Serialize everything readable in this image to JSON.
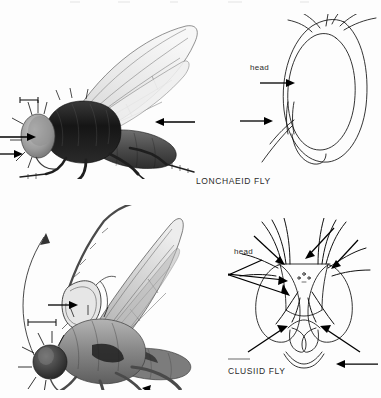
{
  "figure": {
    "title_visible": false,
    "background_color": "#fdfdfd",
    "ink_color": "#1a1a1a",
    "width": 381,
    "height": 398
  },
  "panels": [
    {
      "id": "lonchaeid-habitus",
      "kind": "habitus-illustration",
      "view": "lateral",
      "subject": "Lonchaeid fly",
      "rendering": "stipple-halftone",
      "features_marked": [
        {
          "name": "head",
          "arrow_direction": "right",
          "note": "arrow pointing to head"
        },
        {
          "name": "face",
          "arrow_direction": "right",
          "note": "lower arrow pointing to face"
        },
        {
          "name": "wing-base",
          "arrow_direction": "left",
          "note": "arrow pointing to wing base / calypter"
        }
      ],
      "scale_bar": {
        "present": true,
        "orientation": "horizontal",
        "label": ""
      }
    },
    {
      "id": "lonchaeid-head",
      "kind": "line-diagram",
      "view": "lateral",
      "subject": "Lonchaeid fly head",
      "label": "head",
      "features_marked": [
        {
          "name": "eye",
          "arrow_direction": "right"
        },
        {
          "name": "lower-facial-bristle",
          "arrow_direction": "right"
        }
      ]
    },
    {
      "id": "clusiid-habitus",
      "kind": "habitus-illustration",
      "view": "lateral",
      "subject": "Clusiid fly",
      "rendering": "stipple-halftone",
      "features_marked": [
        {
          "name": "antenna-inset",
          "arrow_direction": "right",
          "note": "magnified antenna inset with curved leader"
        },
        {
          "name": "tarsus",
          "arrow_direction": "right",
          "note": "arrow pointing to hind tarsus"
        }
      ],
      "scale_bar": {
        "present": true,
        "orientation": "horizontal",
        "label": ""
      },
      "inset": {
        "present": true,
        "subject": "antenna",
        "magnified": true
      }
    },
    {
      "id": "clusiid-head",
      "kind": "line-diagram",
      "view": "frontal",
      "subject": "Clusiid fly head",
      "label": "head",
      "features_marked": [
        {
          "name": "frontal-bristle-upper",
          "arrow_direction": "right"
        },
        {
          "name": "frontal-bristle-middle",
          "arrow_direction": "right"
        },
        {
          "name": "frontal-bristle-lower",
          "arrow_direction": "right"
        },
        {
          "name": "ocellar-bristle",
          "arrow_direction": "down-left"
        },
        {
          "name": "vibrissa-left",
          "arrow_direction": "right"
        },
        {
          "name": "vibrissa-right",
          "arrow_direction": "left"
        },
        {
          "name": "mouthparts",
          "arrow_direction": "left"
        }
      ]
    }
  ],
  "captions": {
    "top_specimen": "LONCHAEID FLY",
    "bottom_specimen": "CLUSIID FLY"
  },
  "labels": {
    "head_top": "head",
    "head_bottom": "head"
  }
}
